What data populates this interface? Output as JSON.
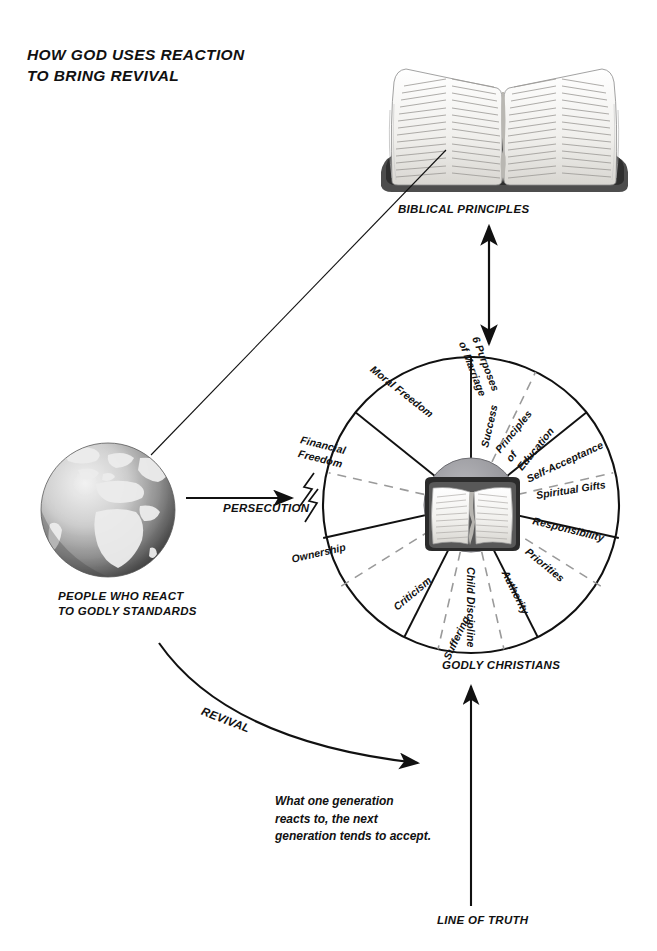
{
  "title": {
    "line1": "HOW GOD USES REACTION",
    "line2": "TO BRING REVIVAL",
    "full": "HOW GOD USES REACTION TO BRING REVIVAL"
  },
  "captions": {
    "biblical_principles": "BIBLICAL PRINCIPLES",
    "persecution": "PERSECUTION",
    "revival": "REVIVAL",
    "godly_christians": "GODLY CHRISTIANS",
    "line_of_truth": "LINE OF TRUTH",
    "people_who_react_line1": "PEOPLE WHO REACT",
    "people_who_react_line2": "TO GODLY STANDARDS"
  },
  "quote": {
    "line1": "What one generation",
    "line2": "reacts to, the next",
    "line3": "generation tends to accept.",
    "full": "What one generation reacts to, the next generation tends to accept."
  },
  "wheel": {
    "hub_icon": "open-bible-icon",
    "segment_count": 14,
    "segments": [
      "Success",
      "Principles of Education",
      "Self-Acceptance",
      "Spiritual Gifts",
      "Responsibility",
      "Priorities",
      "Authority",
      "Child Discipline",
      "Suffering",
      "Criticism",
      "Ownership",
      "Financial Freedom",
      "Moral Freedom",
      "6 Purposes of Marriage"
    ]
  },
  "icons": {
    "globe": "globe-icon",
    "bible_top": "open-bible-icon",
    "lightning": "lightning-bolt-icon",
    "arrow_up": "arrow-up-icon",
    "arrow_double": "double-arrow-icon",
    "arrow_right": "arrow-right-icon",
    "arrow_curved": "curved-arrow-icon"
  },
  "colors": {
    "ink": "#111111",
    "paper": "#ffffff",
    "hub": "#8f8f93",
    "dash": "#9a9a9a",
    "globe_dark": "#4a4a4a",
    "globe_light": "#e2e2e2"
  }
}
